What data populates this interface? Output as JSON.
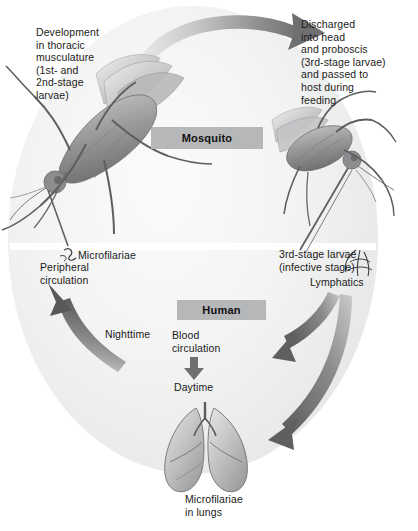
{
  "diagram": {
    "colors": {
      "label_box_fill": "#b6b7b9",
      "arrow_dark": "#6e6f71",
      "arrow_light": "#d3d4d6",
      "text": "#1b1b1b",
      "background": "#ffffff",
      "circle_tint": "#e6e7e8"
    },
    "sections": {
      "mosquito_label": "Mosquito",
      "human_label": "Human"
    },
    "annotations": {
      "development": "Development\nin thoracic\nmusculature\n(1st- and\n2nd-stage\nlarvae)",
      "discharged": "Discharged\ninto head\nand proboscis\n(3rd-stage larvae)\nand passed to\nhost during\nfeeding",
      "microfilariae": "Microfilariae",
      "peripheral_circulation": "Peripheral\ncirculation",
      "third_stage_larvae": "3rd-stage larvae\n(infective stage)",
      "lymphatics": "Lymphatics",
      "nighttime": "Nighttime",
      "blood_circulation": "Blood\ncirculation",
      "daytime": "Daytime",
      "microfilariae_in_lungs": "Microfilariae\nin lungs"
    },
    "illustrations": {
      "mosquito_left": "mosquito-illustration-left",
      "mosquito_right": "mosquito-illustration-right",
      "lungs": "lungs-illustration"
    },
    "arrows": [
      {
        "name": "arrow-top-mosquito-to-mosquito",
        "direction": "left-to-right"
      },
      {
        "name": "arrow-left-up-to-peripheral-circulation",
        "direction": "upward"
      },
      {
        "name": "arrow-right-inward-to-human",
        "direction": "right-to-left"
      },
      {
        "name": "arrow-right-down-to-lungs",
        "direction": "right-to-left-down"
      },
      {
        "name": "arrow-blood-circulation-down",
        "direction": "downward"
      }
    ]
  }
}
